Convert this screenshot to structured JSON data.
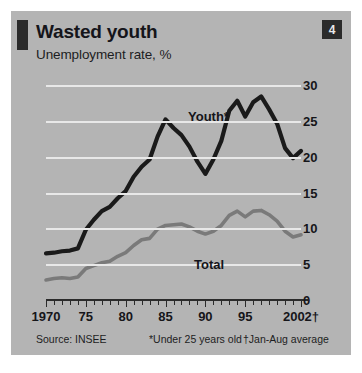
{
  "header": {
    "title": "Wasted youth",
    "subtitle": "Unemployment rate, %",
    "badge": "4"
  },
  "footer": {
    "source": "Source: INSEE",
    "note_star": "*Under 25 years old",
    "note_dagger": "†Jan-Aug average"
  },
  "labels": {
    "youth": "Youth*",
    "total": "Total"
  },
  "colors": {
    "panel": "#b4b4b4",
    "grid": "#e8e8e8",
    "youth": "#1a1a1a",
    "total": "#7a7a7a",
    "ink": "#15151a",
    "badge_bg": "#2b2b2b"
  },
  "chart_data": {
    "type": "line",
    "title": "Wasted youth",
    "subtitle": "Unemployment rate, %",
    "xlabel": "",
    "ylabel": "Unemployment rate, %",
    "xlim": [
      1970,
      2002
    ],
    "ylim": [
      0,
      30
    ],
    "yticks": [
      0,
      5,
      10,
      15,
      20,
      25,
      30
    ],
    "ytick_labels": [
      "0",
      "5",
      "10",
      "15",
      "20",
      "25",
      "30"
    ],
    "xticks": [
      1970,
      1975,
      1980,
      1985,
      1990,
      1995,
      2002
    ],
    "xtick_labels": [
      "1970",
      "75",
      "80",
      "85",
      "90",
      "95",
      "2002†"
    ],
    "grid": "horizontal",
    "legend": "inline-labels",
    "x": [
      1970,
      1971,
      1972,
      1973,
      1974,
      1975,
      1976,
      1977,
      1978,
      1979,
      1980,
      1981,
      1982,
      1983,
      1984,
      1985,
      1986,
      1987,
      1988,
      1989,
      1990,
      1991,
      1992,
      1993,
      1994,
      1995,
      1996,
      1997,
      1998,
      1999,
      2000,
      2001,
      2002
    ],
    "series": [
      {
        "name": "Youth*",
        "color": "#1a1a1a",
        "values": [
          6.5,
          6.6,
          6.8,
          6.9,
          7.2,
          9.8,
          11.2,
          12.4,
          13.0,
          14.2,
          15.2,
          17.2,
          18.6,
          19.6,
          22.8,
          25.2,
          24.0,
          23.0,
          21.4,
          19.3,
          17.6,
          19.6,
          22.2,
          26.4,
          27.8,
          25.6,
          27.6,
          28.4,
          26.6,
          24.6,
          21.2,
          19.8,
          20.8
        ]
      },
      {
        "name": "Total",
        "color": "#7a7a7a",
        "values": [
          2.8,
          3.0,
          3.1,
          3.0,
          3.2,
          4.4,
          4.8,
          5.2,
          5.4,
          6.1,
          6.6,
          7.6,
          8.4,
          8.6,
          9.9,
          10.4,
          10.5,
          10.6,
          10.2,
          9.6,
          9.2,
          9.6,
          10.4,
          11.8,
          12.4,
          11.6,
          12.4,
          12.5,
          11.9,
          11.0,
          9.6,
          8.8,
          9.1
        ]
      }
    ],
    "annotations": [
      {
        "text": "Youth*",
        "series": "Youth*"
      },
      {
        "text": "Total",
        "series": "Total"
      }
    ],
    "source": "Source: INSEE",
    "notes": [
      "*Under 25 years old",
      "†Jan-Aug average"
    ]
  }
}
